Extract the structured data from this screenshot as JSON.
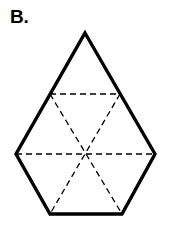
{
  "figure": {
    "label": "B.",
    "background_color": "#ffffff",
    "stroke_color": "#000000",
    "solid_stroke_width": 3.4,
    "dashed_stroke_width": 1.3,
    "dash_pattern": "6 4",
    "outline_name": "pentagon-outline",
    "outline_points": "85,33 155,154 122,214 50,214 16,154",
    "vertices": [
      {
        "name": "apex",
        "x": 85,
        "y": 33
      },
      {
        "name": "upper-right",
        "x": 155,
        "y": 154
      },
      {
        "name": "lower-right",
        "x": 122,
        "y": 214
      },
      {
        "name": "lower-left",
        "x": 50,
        "y": 214
      },
      {
        "name": "upper-left",
        "x": 16,
        "y": 154
      }
    ],
    "dashed_lines": [
      {
        "name": "dashed-line-upper-horizontal",
        "x1": 50,
        "y1": 94,
        "x2": 120,
        "y2": 94
      },
      {
        "name": "dashed-line-middle-horizontal",
        "x1": 16,
        "y1": 154,
        "x2": 155,
        "y2": 154
      },
      {
        "name": "dashed-line-diagonal-nw-se",
        "x1": 50,
        "y1": 94,
        "x2": 122,
        "y2": 214
      },
      {
        "name": "dashed-line-diagonal-ne-sw",
        "x1": 120,
        "y1": 94,
        "x2": 50,
        "y2": 214
      }
    ]
  }
}
